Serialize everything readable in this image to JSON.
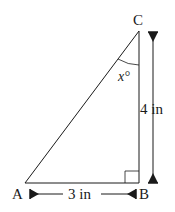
{
  "diagram": {
    "type": "right-triangle",
    "vertices": {
      "A": {
        "label": "A"
      },
      "B": {
        "label": "B"
      },
      "C": {
        "label": "C"
      }
    },
    "angle_label": "x°",
    "right_angle_at": "B",
    "dimensions": {
      "AB": {
        "label": "3 in"
      },
      "BC": {
        "label": "4 in"
      }
    },
    "colors": {
      "stroke": "#1a1a1a",
      "background": "#ffffff"
    }
  }
}
